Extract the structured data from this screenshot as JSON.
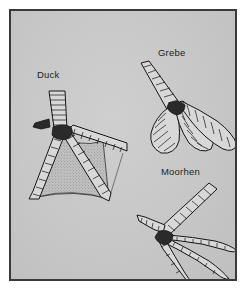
{
  "figure": {
    "background_color": "#c9c9c9",
    "border_color": "#3a3a3a",
    "page_color": "#ffffff",
    "ink_color": "#1a1a1a",
    "label_color": "#1d1d1d"
  },
  "specimens": [
    {
      "id": "duck",
      "label": "Duck",
      "foot_type": "palmate-webbed-foot",
      "toe_count": 3,
      "webbing": true
    },
    {
      "id": "grebe",
      "label": "Grebe",
      "foot_type": "lobed-foot",
      "toe_count": 3,
      "webbing": false
    },
    {
      "id": "moorhen",
      "label": "Moorhen",
      "foot_type": "unwebbed-long-toed-foot",
      "toe_count": 4,
      "webbing": false
    }
  ]
}
